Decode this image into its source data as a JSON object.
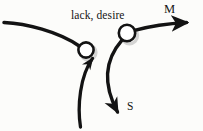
{
  "diagram": {
    "title_text": "lack, desire",
    "labels": {
      "annotation": "lack, desire",
      "m": "M",
      "s": "S"
    },
    "colors": {
      "background": "#fcfcfa",
      "stroke": "#131313",
      "node_fill": "#ffffff",
      "shadow": "#9a9a9a",
      "text": "#141414"
    },
    "nodes": [
      {
        "name": "node-left",
        "cx": 86,
        "cy": 50,
        "r": 7.6
      },
      {
        "name": "node-right",
        "cx": 127,
        "cy": 33,
        "r": 8.2
      }
    ],
    "edges": [
      {
        "name": "edge-incoming-left",
        "from": "left-margin",
        "to": "node-left",
        "arrow": false
      },
      {
        "name": "edge-m-arrow",
        "from": "node-right",
        "to": "M",
        "arrow": true
      },
      {
        "name": "edge-up-to-left-node",
        "from": "bottom-left",
        "to": "node-left",
        "arrow": true
      },
      {
        "name": "edge-s-arrow",
        "from": "node-right",
        "to": "S",
        "arrow": true
      }
    ]
  }
}
